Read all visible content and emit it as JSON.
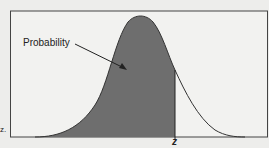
{
  "diagram": {
    "annotation_label": "Probability",
    "axis_marker_label": "z",
    "edge_fragment": "z.",
    "colors": {
      "background": "#ededeb",
      "shaded_area": "#6e6e6e",
      "curve": "#333333",
      "border": "#444444"
    }
  }
}
